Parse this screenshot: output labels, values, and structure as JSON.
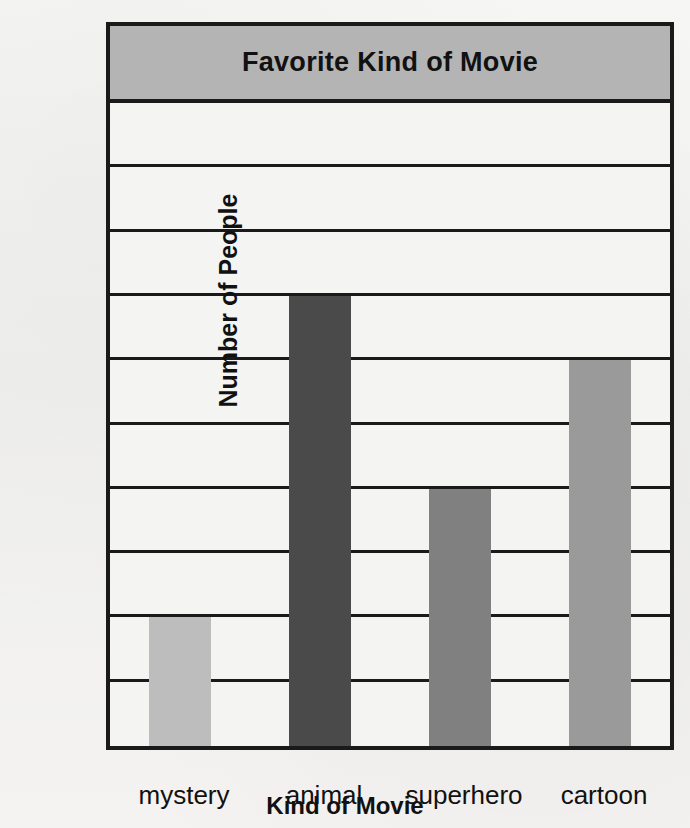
{
  "chart_data": {
    "type": "bar",
    "title": "Favorite Kind of Movie",
    "xlabel": "Kind of Movie",
    "ylabel": "Number of People",
    "categories": [
      "mystery",
      "animal",
      "superhero",
      "cartoon"
    ],
    "values": [
      2,
      7,
      4,
      6
    ],
    "ylim": [
      0,
      10
    ],
    "ytick_labels": [
      "0",
      "1",
      "2",
      "3",
      "4",
      "5",
      "6",
      "7",
      "8",
      "9",
      "10"
    ],
    "ytick_values": [
      0,
      1,
      2,
      3,
      4,
      5,
      6,
      7,
      8,
      9,
      10
    ],
    "grid": true,
    "legend": false,
    "bar_colors": [
      "#bdbdbd",
      "#4a4a4a",
      "#808080",
      "#9a9a9a"
    ],
    "series": [
      {
        "name": "Number of People",
        "values": [
          2,
          7,
          4,
          6
        ]
      }
    ]
  },
  "style": {
    "title_band_color": "#b4b4b4",
    "frame_color": "#1a1a1a",
    "plot_background": "#f4f4f2",
    "text_color": "#111111"
  }
}
